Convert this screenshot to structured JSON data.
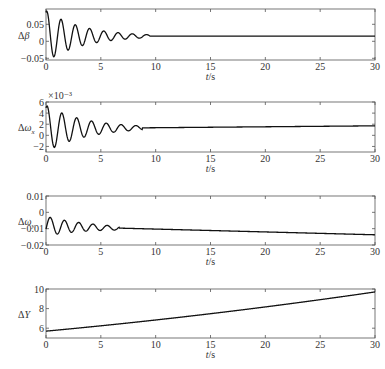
{
  "figure": {
    "panels": [
      {
        "id": "delta-beta",
        "ylabel": "Δβ",
        "ylabel_parts": {
          "main": "Δ",
          "sym": "β",
          "sub": ""
        },
        "exponent": "",
        "box": {
          "x0": 46,
          "x1": 375,
          "y0": 9,
          "y1": 60
        },
        "ylim": [
          -0.055,
          0.095
        ],
        "yticks": [
          -0.05,
          0,
          0.05
        ],
        "ytick_labels": [
          "−0.05",
          "0",
          "0.05"
        ],
        "xticks": [
          0,
          5,
          10,
          15,
          20,
          25,
          30
        ],
        "xtick_labels": [
          "0",
          "5",
          "10",
          "15",
          "20",
          "25",
          "30"
        ],
        "xlabel": "t/s",
        "signal": {
          "kind": "damped",
          "offset": 0.015,
          "amp": 0.075,
          "decay": 0.3,
          "period": 1.3,
          "phase": 1.2,
          "settle": 9.5,
          "drift": 0.0
        }
      },
      {
        "id": "delta-omega-x",
        "ylabel": "Δωx",
        "ylabel_parts": {
          "main": "Δ",
          "sym": "ω",
          "sub": "x"
        },
        "exponent": "×10⁻³",
        "box": {
          "x0": 46,
          "x1": 375,
          "y0": 102,
          "y1": 152
        },
        "ylim": [
          -3,
          6
        ],
        "yticks": [
          -2,
          0,
          2,
          4,
          6
        ],
        "ytick_labels": [
          "−2",
          "0",
          "2",
          "4",
          "6"
        ],
        "xticks": [
          0,
          5,
          10,
          15,
          20,
          25,
          30
        ],
        "xtick_labels": [
          "0",
          "5",
          "10",
          "15",
          "20",
          "25",
          "30"
        ],
        "xlabel": "t/s",
        "signal": {
          "kind": "damped",
          "offset": 1.2,
          "amp": 4.2,
          "decay": 0.28,
          "period": 1.35,
          "phase": 1.1,
          "settle": 8.8,
          "drift": 0.017
        }
      },
      {
        "id": "delta-omega-y",
        "ylabel": "Δωy",
        "ylabel_parts": {
          "main": "Δ",
          "sym": "ω",
          "sub": "y"
        },
        "exponent": "",
        "box": {
          "x0": 46,
          "x1": 375,
          "y0": 196,
          "y1": 245
        },
        "ylim": [
          -0.02,
          0.01
        ],
        "yticks": [
          -0.02,
          -0.01,
          0,
          0.01
        ],
        "ytick_labels": [
          "−0.02",
          "−0.01",
          "0",
          "0.01"
        ],
        "xticks": [
          0,
          5,
          10,
          15,
          20,
          25,
          30
        ],
        "xtick_labels": [
          "0",
          "5",
          "10",
          "15",
          "20",
          "25",
          "30"
        ],
        "xlabel": "t/s",
        "signal": {
          "kind": "damped",
          "offset": -0.0085,
          "amp": 0.006,
          "decay": 0.25,
          "period": 1.3,
          "phase": -0.3,
          "settle": 6.7,
          "drift": -0.000175
        }
      },
      {
        "id": "delta-y",
        "ylabel": "ΔY",
        "ylabel_parts": {
          "main": "Δ",
          "sym": "Y",
          "sub": ""
        },
        "exponent": "",
        "box": {
          "x0": 46,
          "x1": 375,
          "y0": 289,
          "y1": 338
        },
        "ylim": [
          5,
          10
        ],
        "yticks": [
          6,
          8,
          10
        ],
        "ytick_labels": [
          "6",
          "8",
          "10"
        ],
        "xticks": [
          0,
          5,
          10,
          15,
          20,
          25,
          30
        ],
        "xtick_labels": [
          "0",
          "5",
          "10",
          "15",
          "20",
          "25",
          "30"
        ],
        "xlabel": "t/s",
        "signal": {
          "kind": "curve",
          "y0": 5.7,
          "y1": 9.7
        }
      }
    ]
  },
  "chart_data": [
    {
      "type": "line",
      "title": "",
      "xlabel": "t/s",
      "ylabel": "Δβ",
      "xlim": [
        0,
        30
      ],
      "ylim": [
        -0.05,
        0.09
      ],
      "yticks": [
        -0.05,
        0,
        0.05
      ],
      "grid": false,
      "legend": null,
      "series": [
        {
          "name": "Δβ",
          "x": [
            0,
            0.3,
            0.9,
            1.6,
            2.2,
            2.9,
            3.5,
            4.2,
            4.8,
            5.5,
            6.1,
            6.8,
            7.5,
            8.1,
            9.5,
            15,
            20,
            25,
            30
          ],
          "values": [
            0.01,
            0.085,
            -0.045,
            0.055,
            -0.012,
            0.038,
            -0.005,
            0.028,
            0.0,
            0.022,
            0.005,
            0.02,
            0.008,
            0.017,
            0.015,
            0.015,
            0.015,
            0.015,
            0.015
          ]
        }
      ]
    },
    {
      "type": "line",
      "title": "",
      "xlabel": "t/s",
      "ylabel": "Δωx (×10⁻³)",
      "xlim": [
        0,
        30
      ],
      "ylim": [
        -3,
        6
      ],
      "yticks": [
        -2,
        0,
        2,
        4,
        6
      ],
      "grid": false,
      "legend": null,
      "series": [
        {
          "name": "Δωx",
          "x": [
            0,
            0.3,
            0.9,
            1.6,
            2.3,
            2.9,
            3.6,
            4.3,
            4.9,
            5.6,
            6.2,
            7.0,
            7.6,
            8.2,
            9.0,
            15,
            20,
            25,
            30
          ],
          "values": [
            2.5,
            5.5,
            -2.2,
            3.6,
            -0.8,
            2.5,
            -0.2,
            2.0,
            0.5,
            1.7,
            0.9,
            1.5,
            1.2,
            1.5,
            1.3,
            1.4,
            1.6,
            1.8,
            2.0
          ]
        }
      ]
    },
    {
      "type": "line",
      "title": "",
      "xlabel": "t/s",
      "ylabel": "Δωy",
      "xlim": [
        0,
        30
      ],
      "ylim": [
        -0.02,
        0.01
      ],
      "yticks": [
        -0.02,
        -0.01,
        0,
        0.01
      ],
      "grid": false,
      "legend": null,
      "series": [
        {
          "name": "Δωy",
          "x": [
            0,
            0.5,
            1.2,
            1.8,
            2.5,
            3.1,
            3.9,
            4.5,
            5.1,
            5.8,
            6.4,
            6.7,
            10,
            15,
            20,
            25,
            30
          ],
          "values": [
            0.0,
            -0.013,
            -0.003,
            -0.011,
            -0.005,
            -0.0095,
            -0.006,
            -0.009,
            -0.007,
            -0.0088,
            -0.0075,
            -0.0085,
            -0.009,
            -0.0095,
            -0.0105,
            -0.0115,
            -0.013
          ]
        }
      ]
    },
    {
      "type": "line",
      "title": "",
      "xlabel": "t/s",
      "ylabel": "ΔY",
      "xlim": [
        0,
        30
      ],
      "ylim": [
        5,
        10
      ],
      "yticks": [
        6,
        8,
        10
      ],
      "grid": false,
      "legend": null,
      "series": [
        {
          "name": "ΔY",
          "x": [
            0,
            5,
            10,
            15,
            20,
            25,
            30
          ],
          "values": [
            5.7,
            6.25,
            6.8,
            7.4,
            8.1,
            8.85,
            9.7
          ]
        }
      ]
    }
  ]
}
